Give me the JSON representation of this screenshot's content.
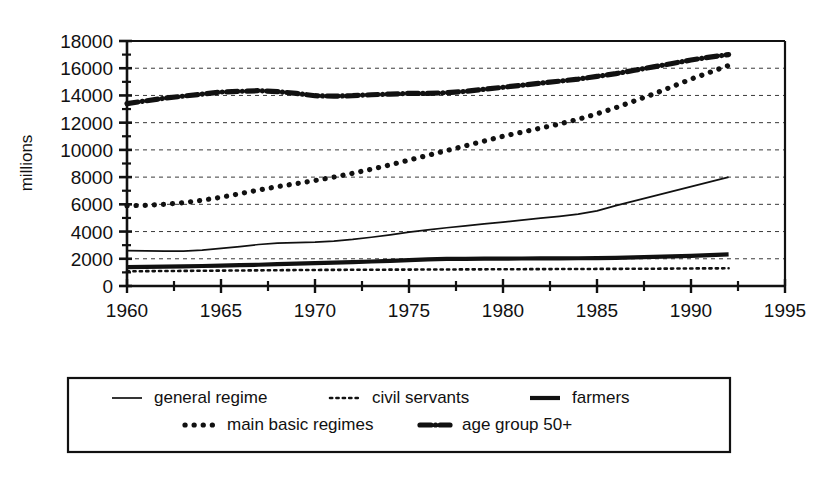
{
  "chart_data": {
    "type": "line",
    "title": "",
    "xlabel": "",
    "ylabel": "millions",
    "xlim": [
      1960,
      1995
    ],
    "ylim": [
      0,
      18000
    ],
    "grid": true,
    "legend_position": "bottom",
    "x_ticks": [
      "1960",
      "1965",
      "1970",
      "1975",
      "1980",
      "1985",
      "1990",
      "1995"
    ],
    "x_tick_values": [
      1960,
      1965,
      1970,
      1975,
      1980,
      1985,
      1990,
      1995
    ],
    "x_minor_step": 2.5,
    "y_ticks": [
      "0",
      "2000",
      "4000",
      "6000",
      "8000",
      "10000",
      "12000",
      "14000",
      "16000",
      "18000"
    ],
    "y_tick_values": [
      0,
      2000,
      4000,
      6000,
      8000,
      10000,
      12000,
      14000,
      16000,
      18000
    ],
    "y_minor_step": 1000,
    "x": [
      1960,
      1961,
      1962,
      1963,
      1964,
      1965,
      1966,
      1967,
      1968,
      1969,
      1970,
      1971,
      1972,
      1973,
      1974,
      1975,
      1976,
      1977,
      1978,
      1979,
      1980,
      1981,
      1982,
      1983,
      1984,
      1985,
      1986,
      1987,
      1988,
      1989,
      1990,
      1991,
      1992
    ],
    "series": [
      {
        "name": "general regime",
        "style": "solid-thin",
        "values": [
          2600,
          2580,
          2560,
          2560,
          2640,
          2760,
          2900,
          3050,
          3150,
          3180,
          3220,
          3300,
          3420,
          3580,
          3760,
          3960,
          4130,
          4280,
          4420,
          4560,
          4700,
          4840,
          4980,
          5120,
          5280,
          5520,
          5900,
          6250,
          6600,
          6950,
          7300,
          7650,
          8000
        ]
      },
      {
        "name": "civil servants",
        "style": "dotted-fine",
        "values": [
          1080,
          1090,
          1100,
          1110,
          1120,
          1130,
          1140,
          1150,
          1160,
          1170,
          1180,
          1185,
          1190,
          1195,
          1200,
          1205,
          1210,
          1215,
          1220,
          1225,
          1230,
          1235,
          1240,
          1245,
          1250,
          1255,
          1260,
          1265,
          1270,
          1280,
          1290,
          1295,
          1300
        ]
      },
      {
        "name": "farmers",
        "style": "solid-thick",
        "values": [
          1380,
          1400,
          1420,
          1440,
          1470,
          1500,
          1530,
          1560,
          1600,
          1640,
          1680,
          1720,
          1760,
          1800,
          1850,
          1900,
          1960,
          1990,
          2000,
          2010,
          2015,
          2020,
          2025,
          2030,
          2040,
          2050,
          2070,
          2100,
          2140,
          2180,
          2220,
          2270,
          2320
        ]
      },
      {
        "name": "main basic regimes",
        "style": "dotted-thick",
        "values": [
          5900,
          5930,
          6000,
          6120,
          6300,
          6520,
          6780,
          7050,
          7300,
          7520,
          7750,
          8000,
          8280,
          8580,
          8900,
          9250,
          9600,
          9950,
          10300,
          10650,
          11000,
          11300,
          11600,
          11900,
          12250,
          12650,
          13100,
          13600,
          14100,
          14650,
          15200,
          15700,
          16200
        ]
      },
      {
        "name": "age group 50+",
        "style": "dashdot-thick",
        "values": [
          13400,
          13600,
          13800,
          13950,
          14100,
          14250,
          14300,
          14350,
          14280,
          14150,
          13980,
          13950,
          13980,
          14050,
          14100,
          14150,
          14150,
          14200,
          14300,
          14450,
          14600,
          14750,
          14900,
          15050,
          15200,
          15400,
          15600,
          15850,
          16100,
          16350,
          16600,
          16820,
          17000
        ]
      }
    ],
    "legend_rows": [
      [
        {
          "label": "general regime",
          "style": "solid-thin"
        },
        {
          "label": "civil servants",
          "style": "dotted-fine"
        },
        {
          "label": "farmers",
          "style": "solid-thick"
        }
      ],
      [
        {
          "label": "main basic regimes",
          "style": "dotted-thick"
        },
        {
          "label": "age group 50+",
          "style": "dashdot-thick"
        }
      ]
    ]
  },
  "colors": {
    "ink": "#111111",
    "grid": "#3a3a3a",
    "background": "#ffffff"
  }
}
